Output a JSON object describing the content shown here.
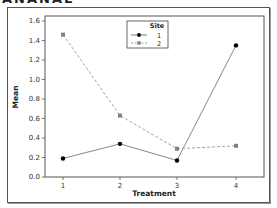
{
  "header": {
    "cut_title": "ANANAE"
  },
  "chart_data": {
    "type": "line",
    "title": "",
    "xlabel": "Treatment",
    "ylabel": "Mean",
    "categories": [
      "1",
      "2",
      "3",
      "4"
    ],
    "x": [
      1,
      2,
      3,
      4
    ],
    "ylim": [
      0.0,
      1.6
    ],
    "yticks": [
      "0.0",
      "0.2",
      "0.4",
      "0.6",
      "0.8",
      "1.0",
      "1.2",
      "1.4",
      "1.6"
    ],
    "grid": false,
    "legend": {
      "title": "Site",
      "position": "top-center",
      "entries": [
        "1",
        "2"
      ]
    },
    "series": [
      {
        "name": "1",
        "values": [
          0.19,
          0.34,
          0.17,
          1.35
        ],
        "color": "#000000",
        "marker": "circle",
        "line": "solid",
        "line_color": "#7a7a7a"
      },
      {
        "name": "2",
        "values": [
          1.46,
          0.63,
          0.29,
          0.32
        ],
        "color": "#808080",
        "marker": "square",
        "line": "dashed",
        "line_color": "#9a9a9a"
      }
    ]
  }
}
